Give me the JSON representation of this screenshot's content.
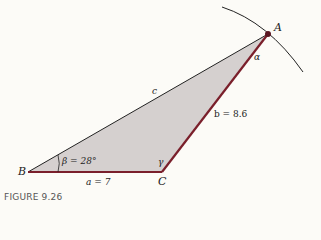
{
  "figure": {
    "caption": "FIGURE 9.26",
    "vertices": {
      "A": "A",
      "B": "B",
      "C": "C"
    },
    "sides": {
      "a": "a = 7",
      "b": "b = 8.6",
      "c": "c"
    },
    "angles": {
      "alpha": "α",
      "beta": "β = 28°",
      "gamma": "γ"
    },
    "colors": {
      "fill": "#d5d0cf",
      "edge": "#7a1f2b",
      "line": "#222222",
      "background": "#fcfbf7"
    }
  }
}
